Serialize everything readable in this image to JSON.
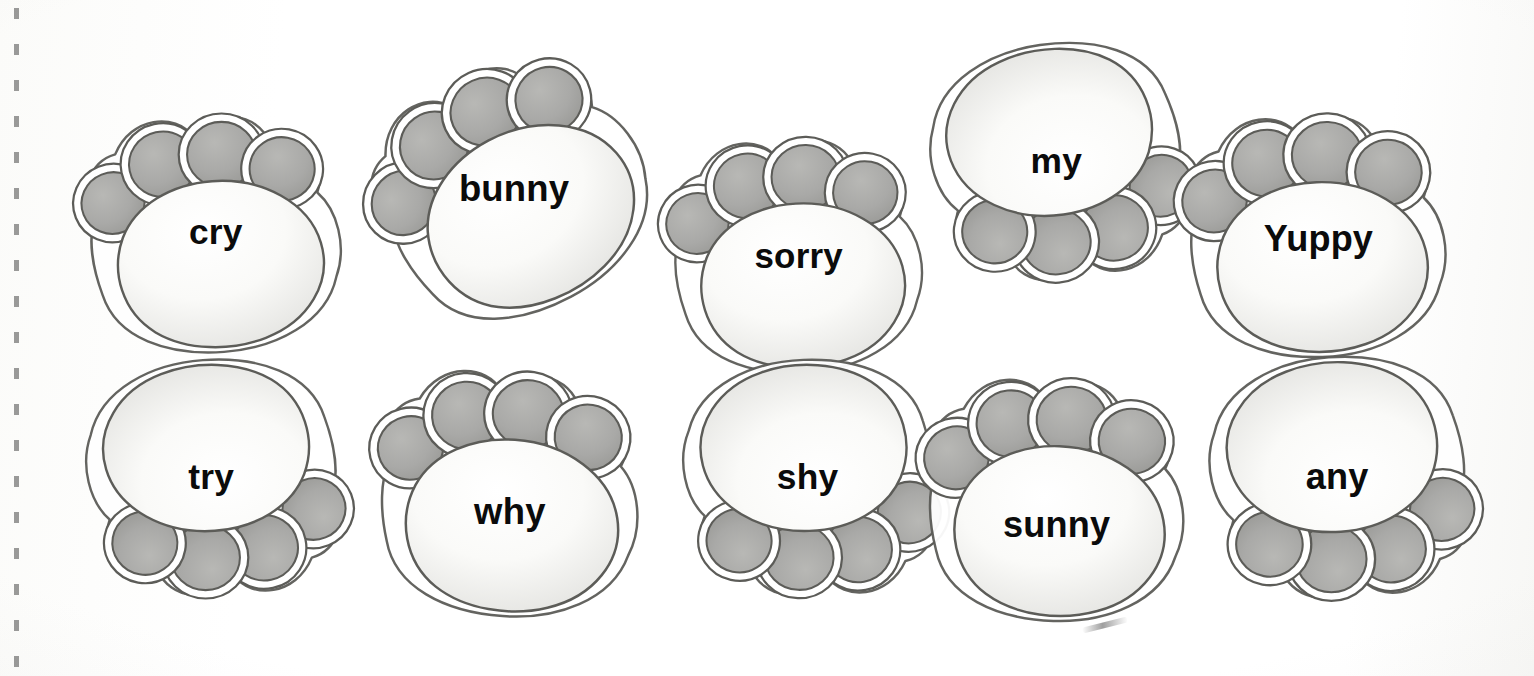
{
  "page": {
    "kind": "worksheet-scan",
    "background_color": "#fdfdfc",
    "binding": "dashed-spiral-edge-left"
  },
  "palette": {
    "toe_pad_fill": "#a9a9a7",
    "toe_pad_fill_light": "#b8b8b5",
    "main_pad_fill": "#fafaf8",
    "main_pad_shade": "#e3e3e0",
    "outline": "#5c5c58",
    "word_color": "#0b0b0b"
  },
  "cards": [
    {
      "word": "cry",
      "row": 1,
      "column": 1,
      "orientation": "toes-up",
      "rotation_deg": -4,
      "x": 55,
      "y": 62,
      "scale": 0.93,
      "word_top": 150,
      "word_size": 38,
      "toe_count": 4
    },
    {
      "word": "bunny",
      "row": 1,
      "column": 2,
      "orientation": "toes-up-right-tilt",
      "rotation_deg": -28,
      "x": 348,
      "y": 18,
      "scale": 0.96,
      "word_top": 152,
      "word_size": 38,
      "toe_count": 4
    },
    {
      "word": "sorry",
      "row": 1,
      "column": 3,
      "orientation": "toes-up",
      "rotation_deg": -3,
      "x": 638,
      "y": 84,
      "scale": 0.92,
      "word_top": 152,
      "word_size": 38,
      "toe_count": 4
    },
    {
      "word": "my",
      "row": 1,
      "column": 4,
      "orientation": "toes-down",
      "rotation_deg": 172,
      "x": 898,
      "y": 14,
      "scale": 0.93,
      "word_top": 152,
      "word_size": 38,
      "toe_count": 4
    },
    {
      "word": "Yuppy",
      "row": 1,
      "column": 5,
      "orientation": "toes-up",
      "rotation_deg": -2,
      "x": 1158,
      "y": 64,
      "scale": 0.95,
      "word_top": 154,
      "word_size": 38,
      "toe_count": 4
    },
    {
      "word": "try",
      "row": 2,
      "column": 1,
      "orientation": "toes-down",
      "rotation_deg": 176,
      "x": 52,
      "y": 330,
      "scale": 0.93,
      "word_top": 152,
      "word_size": 38,
      "toe_count": 4
    },
    {
      "word": "why",
      "row": 2,
      "column": 2,
      "orientation": "toes-up",
      "rotation_deg": 4,
      "x": 352,
      "y": 322,
      "scale": 0.96,
      "word_top": 170,
      "word_size": 38,
      "toe_count": 4
    },
    {
      "word": "shy",
      "row": 2,
      "column": 3,
      "orientation": "toes-down",
      "rotation_deg": 178,
      "x": 648,
      "y": 330,
      "scale": 0.93,
      "word_top": 152,
      "word_size": 38,
      "toe_count": 4
    },
    {
      "word": "sunny",
      "row": 2,
      "column": 4,
      "orientation": "toes-up",
      "rotation_deg": 2,
      "x": 898,
      "y": 328,
      "scale": 0.95,
      "word_top": 178,
      "word_size": 38,
      "toe_count": 4
    },
    {
      "word": "any",
      "row": 2,
      "column": 5,
      "orientation": "toes-down",
      "rotation_deg": 176,
      "x": 1178,
      "y": 330,
      "scale": 0.95,
      "word_top": 152,
      "word_size": 38,
      "toe_count": 4
    }
  ]
}
